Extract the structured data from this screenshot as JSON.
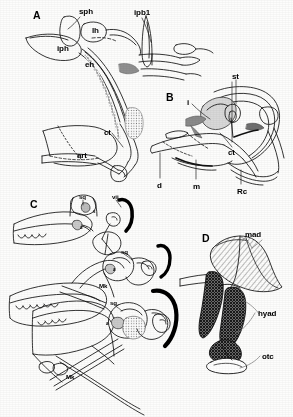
{
  "figure": {
    "background_color": "#fdfdfc",
    "ink_color": "#000000",
    "shading_gray": "#8c8c8c",
    "hatch_gray": "#9a9a9a"
  },
  "panels": [
    {
      "id": "A",
      "letter": "A",
      "letter_pos": {
        "x": 33,
        "y": 10
      },
      "description": "Lateral view of hyobranchial apparatus with ceratohyal, epihyal and interhyal elements",
      "labels": [
        {
          "text": "sph",
          "x": 79,
          "y": 8,
          "size": "anno",
          "leader": true
        },
        {
          "text": "ipb1",
          "x": 134,
          "y": 9,
          "size": "anno",
          "leader": true
        },
        {
          "text": "lh",
          "x": 92,
          "y": 27,
          "size": "anno",
          "leader": false
        },
        {
          "text": "iph",
          "x": 57,
          "y": 45,
          "size": "anno",
          "leader": false
        },
        {
          "text": "eh",
          "x": 85,
          "y": 61,
          "size": "anno",
          "leader": false
        },
        {
          "text": "ct",
          "x": 104,
          "y": 129,
          "size": "anno",
          "leader": true
        },
        {
          "text": "art",
          "x": 77,
          "y": 152,
          "size": "anno",
          "leader": false
        }
      ]
    },
    {
      "id": "B",
      "letter": "B",
      "letter_pos": {
        "x": 166,
        "y": 92
      },
      "description": "Oblique view of suspensorium showing stapes, interhyal, ceratohyal and retroarticular region",
      "labels": [
        {
          "text": "st",
          "x": 232,
          "y": 73,
          "size": "anno",
          "leader": true
        },
        {
          "text": "i",
          "x": 187,
          "y": 99,
          "size": "anno",
          "leader": true
        },
        {
          "text": "ct",
          "x": 228,
          "y": 149,
          "size": "anno",
          "leader": true
        },
        {
          "text": "d",
          "x": 157,
          "y": 182,
          "size": "anno",
          "leader": true
        },
        {
          "text": "m",
          "x": 193,
          "y": 183,
          "size": "anno",
          "leader": true
        },
        {
          "text": "Rc",
          "x": 237,
          "y": 188,
          "size": "anno",
          "leader": true
        }
      ]
    },
    {
      "id": "C",
      "letter": "C",
      "letter_pos": {
        "x": 30,
        "y": 199
      },
      "description": "Three sequential lateral views of jaw suspension with squamosal, facial nerve and Meckel's cartilage",
      "sub_views": [
        {
          "name": "upper",
          "labels": [
            {
              "text": "sq",
              "x": 79,
              "y": 194,
              "size": "anno-sm",
              "leader": true
            },
            {
              "text": "vii",
              "x": 112,
              "y": 194,
              "size": "anno-sm",
              "leader": true
            },
            {
              "text": "s",
              "x": 93,
              "y": 210,
              "size": "anno-xs",
              "leader": false
            },
            {
              "text": "a",
              "x": 80,
              "y": 226,
              "size": "anno-xs",
              "leader": false
            }
          ]
        },
        {
          "name": "middle",
          "labels": [
            {
              "text": "Mk",
              "x": 99,
              "y": 283,
              "size": "anno-sm",
              "leader": false
            },
            {
              "text": "sq",
              "x": 121,
              "y": 249,
              "size": "anno-sm",
              "leader": true
            },
            {
              "text": "a",
              "x": 113,
              "y": 268,
              "size": "anno-xs",
              "leader": false
            }
          ]
        },
        {
          "name": "lower",
          "labels": [
            {
              "text": "sq",
              "x": 110,
              "y": 300,
              "size": "anno-sm",
              "leader": true
            },
            {
              "text": "a",
              "x": 106,
              "y": 322,
              "size": "anno-xs",
              "leader": false
            },
            {
              "text": "Mk",
              "x": 66,
              "y": 374,
              "size": "anno-sm",
              "leader": false
            }
          ]
        }
      ]
    },
    {
      "id": "D",
      "letter": "D",
      "letter_pos": {
        "x": 202,
        "y": 233
      },
      "description": "Muscle reconstruction with mandibular adductor and hyoid adductor musculature over otic capsule",
      "labels": [
        {
          "text": "mad",
          "x": 245,
          "y": 231,
          "size": "anno",
          "leader": true
        },
        {
          "text": "hyad",
          "x": 258,
          "y": 310,
          "size": "anno",
          "leader": true
        },
        {
          "text": "otc",
          "x": 262,
          "y": 353,
          "size": "anno",
          "leader": true
        }
      ]
    }
  ],
  "abbreviations": {
    "sph": "suprapharyngobranchial",
    "ipb1": "infrapharyngobranchial 1",
    "lh": "lateral hyoid process",
    "iph": "interhyal process",
    "eh": "epihyal",
    "ct": "ceratohyal",
    "art": "articular",
    "st": "stapes",
    "i": "interhyal",
    "d": "dentary",
    "m": "mandible",
    "Rc": "retroarticular cartilage",
    "sq": "squamosal",
    "vii": "facial nerve VII",
    "s": "symplectic",
    "a": "articular",
    "Mk": "Meckel's cartilage",
    "mad": "mandibular adductor",
    "hyad": "hyoid adductor",
    "otc": "otic capsule"
  }
}
